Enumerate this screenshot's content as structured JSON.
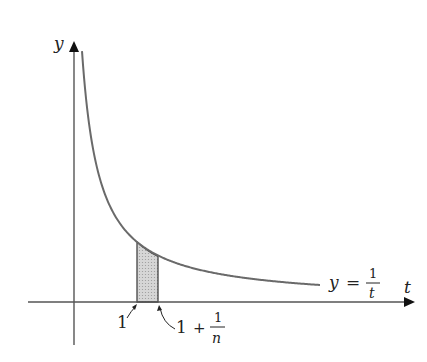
{
  "diagram": {
    "y_axis_label": "y",
    "t_axis_label": "t",
    "curve_label": {
      "lhs": "y",
      "eq": "=",
      "num": "1",
      "den": "t"
    },
    "left_bound_label": "1",
    "right_bound_label": {
      "one": "1",
      "plus": "+",
      "num": "1",
      "den": "n"
    },
    "colors": {
      "curve": "#6a6a6a",
      "axis": "#555555",
      "shade": "#c8c8c8",
      "text": "#222222"
    }
  }
}
